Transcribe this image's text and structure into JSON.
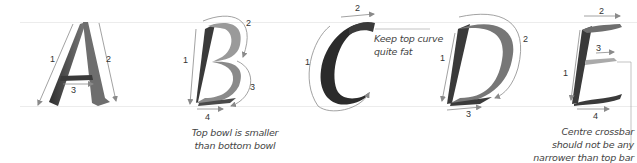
{
  "guides": {
    "top_y": 22,
    "baseline_y": 106,
    "color": "#ececec"
  },
  "colors": {
    "arrow": "#8a8a8a",
    "ink_dark": "#2b2b2b",
    "ink_mid": "#6e6e6e",
    "ink_light": "#a5a5a5"
  },
  "letters": [
    {
      "glyph": "A",
      "strokes": [
        {
          "label": "1"
        },
        {
          "label": "2"
        },
        {
          "label": "3"
        }
      ]
    },
    {
      "glyph": "B",
      "strokes": [
        {
          "label": "1"
        },
        {
          "label": "2"
        },
        {
          "label": "3"
        },
        {
          "label": "4"
        }
      ],
      "note": [
        "Top bowl is smaller",
        "than bottom bowl"
      ]
    },
    {
      "glyph": "C",
      "strokes": [
        {
          "label": "1"
        },
        {
          "label": "2"
        }
      ],
      "note": [
        "Keep top curve",
        "quite fat"
      ]
    },
    {
      "glyph": "D",
      "strokes": [
        {
          "label": "1"
        },
        {
          "label": "2"
        },
        {
          "label": "3"
        }
      ]
    },
    {
      "glyph": "E",
      "strokes": [
        {
          "label": "1"
        },
        {
          "label": "2"
        },
        {
          "label": "3"
        },
        {
          "label": "4"
        }
      ],
      "note": [
        "Centre crossbar",
        "should not be any",
        "narrower than top bar"
      ]
    }
  ]
}
